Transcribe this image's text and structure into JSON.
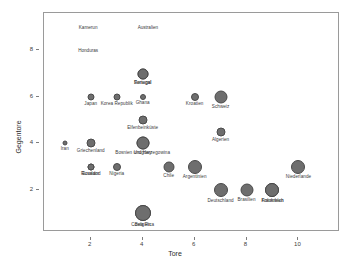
{
  "chart_data": {
    "type": "scatter",
    "title": "",
    "xlabel": "Tore",
    "ylabel": "Gegentore",
    "xlim": [
      0.2,
      11.6
    ],
    "ylim": [
      0.2,
      9.6
    ],
    "xticks": [
      2,
      4,
      6,
      8,
      10
    ],
    "yticks": [
      2,
      4,
      6,
      8
    ],
    "grid": false,
    "legend": "none",
    "bubble_encoding": "marker size encodes matches played / team strength",
    "point_color": "#6e6e6e",
    "points": [
      {
        "label": "Portugal",
        "x": 4,
        "y": 7,
        "size": 11
      },
      {
        "label": "Senegal",
        "x": 4,
        "y": 7,
        "size": 11
      },
      {
        "label": "Japan",
        "x": 2,
        "y": 6,
        "size": 7
      },
      {
        "label": "Korea Republik",
        "x": 3,
        "y": 6,
        "size": 7
      },
      {
        "label": "Ghana",
        "x": 4,
        "y": 6,
        "size": 6
      },
      {
        "label": "Kroatien",
        "x": 6,
        "y": 6,
        "size": 8
      },
      {
        "label": "Schweiz",
        "x": 7,
        "y": 6,
        "size": 13
      },
      {
        "label": "Elfenbeinküste",
        "x": 4,
        "y": 5,
        "size": 9
      },
      {
        "label": "Algerien",
        "x": 7,
        "y": 4.5,
        "size": 9
      },
      {
        "label": "Iran",
        "x": 1,
        "y": 4,
        "size": 5
      },
      {
        "label": "Griechenland",
        "x": 2,
        "y": 4,
        "size": 9
      },
      {
        "label": "Bosnien und Herzegowina",
        "x": 4,
        "y": 4,
        "size": 13
      },
      {
        "label": "Uruguay",
        "x": 4,
        "y": 4,
        "size": 13
      },
      {
        "label": "Russland",
        "x": 2,
        "y": 3,
        "size": 7
      },
      {
        "label": "Nigeria",
        "x": 3,
        "y": 3,
        "size": 8
      },
      {
        "label": "Ecuador",
        "x": 2,
        "y": 3,
        "size": 7
      },
      {
        "label": "Chile",
        "x": 5,
        "y": 3,
        "size": 11
      },
      {
        "label": "Argentinien",
        "x": 6,
        "y": 3,
        "size": 14
      },
      {
        "label": "Niederlande",
        "x": 10,
        "y": 3,
        "size": 14
      },
      {
        "label": "Deutschland",
        "x": 7,
        "y": 2,
        "size": 14
      },
      {
        "label": "Brasilien",
        "x": 8,
        "y": 2,
        "size": 13
      },
      {
        "label": "Frankreich",
        "x": 9,
        "y": 2,
        "size": 14
      },
      {
        "label": "Kolumbien",
        "x": 9,
        "y": 2,
        "size": 14
      },
      {
        "label": "Costa Rica",
        "x": 4,
        "y": 1,
        "size": 16
      },
      {
        "label": "Belgien",
        "x": 4,
        "y": 1,
        "size": 16
      }
    ],
    "unplotted_labels": [
      {
        "label": "Kamerun",
        "x": 1.9,
        "y": 9.0
      },
      {
        "label": "Australien",
        "x": 4.2,
        "y": 9.0
      },
      {
        "label": "Honduras",
        "x": 1.9,
        "y": 8.0
      }
    ]
  }
}
